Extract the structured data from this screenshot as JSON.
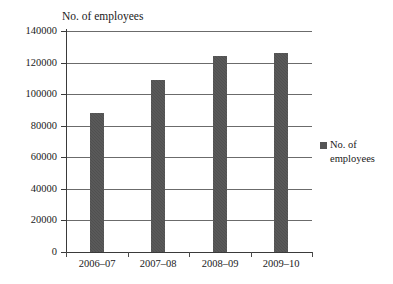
{
  "chart_data": {
    "type": "bar",
    "title": "No. of employees",
    "xlabel": "",
    "ylabel": "",
    "categories": [
      "2006–07",
      "2007–08",
      "2008–09",
      "2009–10"
    ],
    "values": [
      88000,
      109000,
      124000,
      126000
    ],
    "series": [
      {
        "name": "No. of employees",
        "values": [
          88000,
          109000,
          124000,
          126000
        ]
      }
    ],
    "ylim": [
      0,
      140000
    ],
    "yticks": [
      0,
      20000,
      40000,
      60000,
      80000,
      100000,
      120000,
      140000
    ],
    "ytick_labels": [
      "0",
      "20000",
      "40000",
      "60000",
      "80000",
      "100000",
      "120000",
      "140000"
    ],
    "grid": true,
    "legend_position": "right",
    "legend": [
      "No. of employees"
    ],
    "bar_color": "#555555",
    "background_color": "#ffffff",
    "axis_color": "#3a3a3a",
    "gridline_color": "#6b6b6b"
  },
  "legend": {
    "label_line1": "No. of",
    "label_line2": "employees"
  }
}
